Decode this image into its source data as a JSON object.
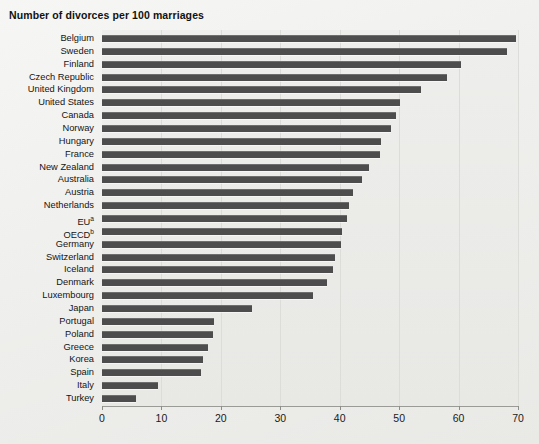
{
  "title": "Number of divorces per 100 marriages",
  "axis": {
    "x_ticks": [
      "0",
      "10",
      "20",
      "30",
      "40",
      "50",
      "60",
      "70"
    ],
    "xmin": 0,
    "xmax": 70
  },
  "chart_data": {
    "type": "bar",
    "orientation": "horizontal",
    "title": "Number of divorces per 100 marriages",
    "xlabel": "",
    "ylabel": "",
    "xlim": [
      0,
      70
    ],
    "grid": true,
    "legend": "none",
    "bar_color": "#4d4d4d",
    "background_color": "#eeeeec",
    "categories": [
      "Belgium",
      "Sweden",
      "Finland",
      "Czech Republic",
      "United Kingdom",
      "United States",
      "Canada",
      "Norway",
      "Hungary",
      "France",
      "New Zealand",
      "Australia",
      "Austria",
      "Netherlands",
      "EUᵃ",
      "OECDᵇ",
      "Germany",
      "Switzerland",
      "Iceland",
      "Denmark",
      "Luxembourg",
      "Japan",
      "Portugal",
      "Poland",
      "Greece",
      "Korea",
      "Spain",
      "Italy",
      "Turkey"
    ],
    "values": [
      69.6,
      68.2,
      60.4,
      58.1,
      53.7,
      50.2,
      49.5,
      48.7,
      47.0,
      46.7,
      45.0,
      43.8,
      42.2,
      41.6,
      41.2,
      40.4,
      40.2,
      39.2,
      38.9,
      37.8,
      35.5,
      25.3,
      18.8,
      18.7,
      17.8,
      17.0,
      16.6,
      9.4,
      5.7
    ]
  },
  "footnotes": {
    "a": "EU",
    "b": "OECD"
  }
}
